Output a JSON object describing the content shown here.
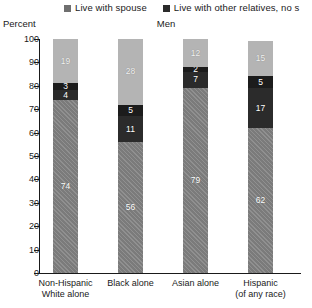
{
  "legend": {
    "items": [
      {
        "label": "Live with spouse",
        "swatch": "#6f6f6f",
        "icon": "square-swatch-icon"
      },
      {
        "label": "Live with other relatives, no s",
        "swatch": "#2b2b2b",
        "icon": "square-swatch-icon"
      }
    ]
  },
  "axis": {
    "y_title": "Percent",
    "ticks": [
      "100",
      "90",
      "80",
      "70",
      "60",
      "50",
      "40",
      "30",
      "20",
      "10",
      "0"
    ]
  },
  "title": "Men",
  "chart_data": {
    "type": "bar",
    "subtype": "stacked-bar-100-percent",
    "title": "Men",
    "xlabel": "",
    "ylabel": "Percent",
    "ylim": [
      0,
      100
    ],
    "ytick_step": 10,
    "grid": false,
    "legend_position": "top",
    "categories": [
      "Non-Hispanic White alone",
      "Black alone",
      "Asian alone",
      "Hispanic (of any race)"
    ],
    "category_lines": [
      [
        "Non-Hispanic",
        "White alone"
      ],
      [
        "Black alone",
        ""
      ],
      [
        "Asian alone",
        ""
      ],
      [
        "Hispanic",
        "(of any race)"
      ]
    ],
    "series": [
      {
        "name": "Live with spouse",
        "color": "#7b7b7b",
        "values": [
          74,
          56,
          79,
          62
        ]
      },
      {
        "name": "Live with other relatives, no s",
        "color": "#2b2b2b",
        "values": [
          4,
          11,
          7,
          17
        ]
      },
      {
        "name": "segment-3",
        "color": "#1c1c1c",
        "values": [
          3,
          5,
          2,
          5
        ]
      },
      {
        "name": "segment-4",
        "color": "#b4b4b4",
        "values": [
          19,
          28,
          12,
          15
        ]
      }
    ],
    "stack_order_bottom_to_top": [
      "Live with spouse",
      "Live with other relatives, no s",
      "segment-3",
      "segment-4"
    ]
  }
}
